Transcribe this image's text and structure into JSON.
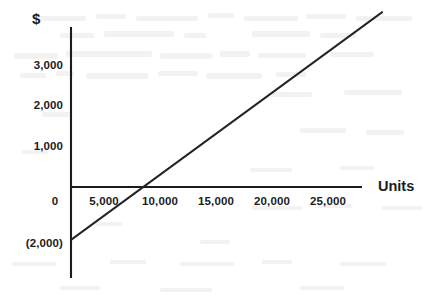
{
  "chart_data": {
    "type": "line",
    "title": "",
    "xlabel": "Units",
    "ylabel": "$",
    "xlim": [
      0,
      28500
    ],
    "ylim": [
      -2000,
      4300
    ],
    "grid": false,
    "legend": null,
    "x_ticks": [
      {
        "value": 0,
        "label": "0"
      },
      {
        "value": 5000,
        "label": "5,000"
      },
      {
        "value": 10000,
        "label": "10,000"
      },
      {
        "value": 15000,
        "label": "15,000"
      },
      {
        "value": 20000,
        "label": "20,000"
      },
      {
        "value": 25000,
        "label": "25,000"
      }
    ],
    "y_ticks": [
      {
        "value": 3000,
        "label": "3,000"
      },
      {
        "value": 2000,
        "label": "2,000"
      },
      {
        "value": 1000,
        "label": "1,000"
      },
      {
        "value": 0,
        "label": "0"
      },
      {
        "value": -2000,
        "label": "(2,000)"
      }
    ],
    "series": [
      {
        "name": "profit-line",
        "color": "#232323",
        "x": [
          0,
          8000,
          28500
        ],
        "y": [
          -1300,
          0,
          4300
        ],
        "breakeven_units": 8000
      }
    ],
    "annotations": []
  },
  "axes": {
    "y_title": "$",
    "x_title": "Units",
    "x_axis_zero_label": "0"
  },
  "colors": {
    "line": "#232323",
    "axis": "#1c1c1c",
    "text": "#1c1c1c",
    "background": "#ffffff"
  }
}
